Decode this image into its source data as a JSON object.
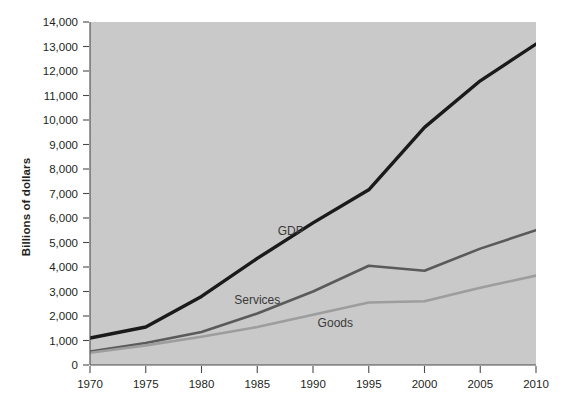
{
  "chart_data": {
    "type": "line",
    "title": "",
    "xlabel": "",
    "ylabel": "Billions of dollars",
    "x": [
      1970,
      1975,
      1980,
      1985,
      1990,
      1995,
      2000,
      2005,
      2010
    ],
    "categories": [
      "1970",
      "1975",
      "1980",
      "1985",
      "1990",
      "1995",
      "2000",
      "2005",
      "2010"
    ],
    "xlim": [
      1970,
      2010
    ],
    "ylim": [
      0,
      14000
    ],
    "ytick_values": [
      0,
      1000,
      2000,
      3000,
      4000,
      5000,
      6000,
      7000,
      8000,
      9000,
      10000,
      11000,
      12000,
      13000,
      14000
    ],
    "ytick_labels": [
      "0",
      "1,000",
      "2,000",
      "3,000",
      "4,000",
      "5,000",
      "6,000",
      "7,000",
      "8,000",
      "9,000",
      "10,000",
      "11,000",
      "12,000",
      "13,000",
      "14,000"
    ],
    "xtick_values": [
      1970,
      1975,
      1980,
      1985,
      1990,
      1995,
      2000,
      2005,
      2010
    ],
    "xtick_labels": [
      "1970",
      "1975",
      "1980",
      "1985",
      "1990",
      "1995",
      "2000",
      "2005",
      "2010"
    ],
    "grid": false,
    "legend_position": "inline-labels",
    "plot_background": "#c9c9c9",
    "series": [
      {
        "name": "GDP",
        "label": "GDP",
        "color": "#1a1a1a",
        "width": 3.4,
        "label_x": 1988,
        "label_y": 5450,
        "values": [
          1100,
          1550,
          2800,
          4350,
          5800,
          7150,
          9700,
          11600,
          13100
        ]
      },
      {
        "name": "Services",
        "label": "Services",
        "color": "#5a5a5a",
        "width": 2.6,
        "label_x": 1985,
        "label_y": 2650,
        "values": [
          550,
          900,
          1350,
          2100,
          3000,
          4050,
          3850,
          4750,
          5500
        ]
      },
      {
        "name": "Goods",
        "label": "Goods",
        "color": "#9d9d9d",
        "width": 2.6,
        "label_x": 1992,
        "label_y": 1700,
        "values": [
          500,
          800,
          1150,
          1550,
          2050,
          2550,
          2600,
          3150,
          3650
        ]
      }
    ]
  }
}
